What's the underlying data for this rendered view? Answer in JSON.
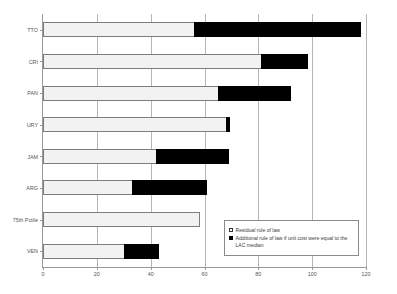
{
  "chart_data": {
    "type": "bar",
    "orientation": "horizontal",
    "stacked": true,
    "title": "",
    "xlabel": "",
    "ylabel": "",
    "xlim": [
      0,
      120
    ],
    "xticks": [
      0,
      20,
      40,
      60,
      80,
      100,
      120
    ],
    "xtick_labels": [
      "0",
      "20",
      "40",
      "60",
      "80",
      "100",
      "120"
    ],
    "grid": true,
    "grid_axis": "x",
    "categories": [
      "TTO",
      "CRI",
      "PAN",
      "URY",
      "JAM",
      "ARG",
      "75th Pctile",
      "VEN"
    ],
    "series": [
      {
        "name": "Residual rule of law",
        "color": "#f2f2f2",
        "values": [
          56,
          81,
          65,
          68,
          42,
          33,
          58.5,
          30
        ]
      },
      {
        "name": "Additional rule of law if unit cost were equal to the LAC median",
        "color": "#000000",
        "values": [
          62,
          17.5,
          27,
          1.5,
          27,
          28,
          0,
          13
        ]
      }
    ],
    "totals": [
      118,
      98.5,
      92,
      69.5,
      69,
      61,
      58.5,
      43
    ],
    "legend": {
      "position": "bottom-right-inside",
      "entries": [
        {
          "label": "Residual rule of law",
          "swatch": "open-square"
        },
        {
          "label": "Additional rule of law if unit cost were equal to the LAC median",
          "swatch": "filled-square"
        }
      ]
    }
  }
}
